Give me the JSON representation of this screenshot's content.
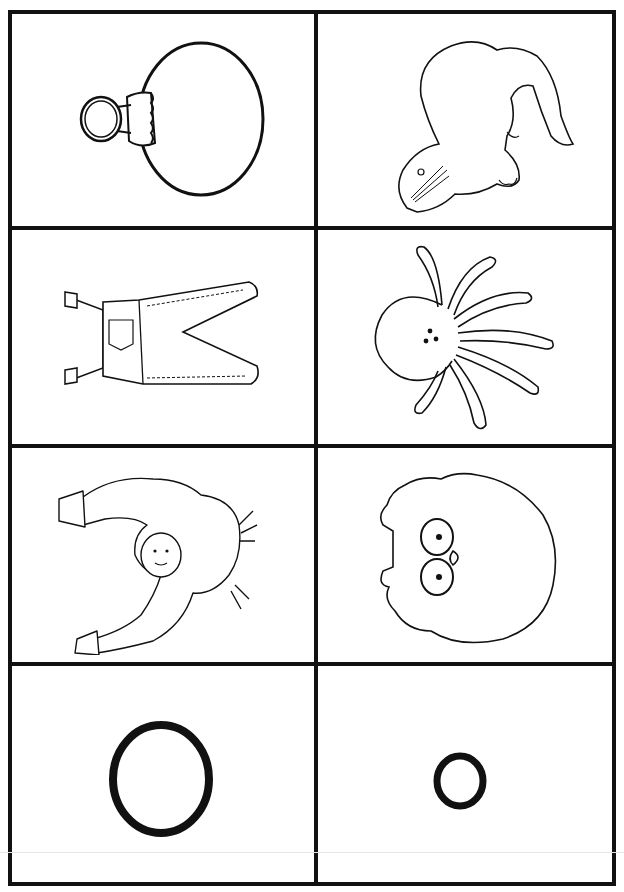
{
  "worksheet": {
    "title": "Letter O picture cards",
    "line_color": "#111111",
    "background": "#ffffff",
    "cells": [
      {
        "row": 1,
        "col": 1,
        "picture": "ornament",
        "label": "ornament"
      },
      {
        "row": 1,
        "col": 2,
        "picture": "otter",
        "label": "otter"
      },
      {
        "row": 2,
        "col": 1,
        "picture": "overalls",
        "label": "overalls"
      },
      {
        "row": 2,
        "col": 2,
        "picture": "octopus",
        "label": "octopus"
      },
      {
        "row": 3,
        "col": 1,
        "picture": "orangutan",
        "label": "orangutan"
      },
      {
        "row": 3,
        "col": 2,
        "picture": "owl",
        "label": "owl"
      },
      {
        "row": 4,
        "col": 1,
        "picture": "uppercase-letter",
        "label": "O"
      },
      {
        "row": 4,
        "col": 2,
        "picture": "lowercase-letter",
        "label": "o"
      }
    ]
  }
}
